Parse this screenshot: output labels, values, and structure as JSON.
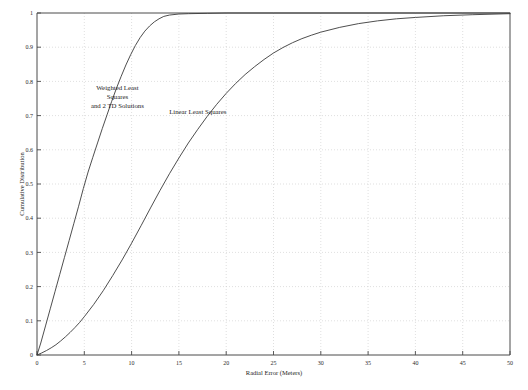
{
  "chart_data": {
    "type": "line",
    "title": "",
    "subtitle": "",
    "xlabel": "Radial Error (Meters)",
    "ylabel": "Cumulative Distribution",
    "xlim": [
      0,
      50
    ],
    "ylim": [
      0,
      1
    ],
    "grid": true,
    "legend_position": "inline-annotations",
    "xticks": [
      0,
      5,
      10,
      15,
      20,
      25,
      30,
      35,
      40,
      45,
      50
    ],
    "xtick_labels": [
      "0",
      "5",
      "10",
      "15",
      "20",
      "25",
      "30",
      "35",
      "40",
      "45",
      "50"
    ],
    "yticks": [
      0,
      0.1,
      0.2,
      0.3,
      0.4,
      0.5,
      0.6,
      0.7,
      0.8,
      0.9,
      1
    ],
    "ytick_labels": [
      "0",
      "0.1",
      "0.2",
      "0.3",
      "0.4",
      "0.5",
      "0.6",
      "0.7",
      "0.8",
      "0.9",
      "1"
    ],
    "annotations": [
      {
        "id": "weighted-least-squares-label",
        "lines": [
          "Weighted Least",
          "Squares",
          "and 2 TD Solutions"
        ],
        "x": 8.5,
        "y": 0.775
      },
      {
        "id": "linear-least-squares-label",
        "lines": [
          "Linear Least Squares"
        ],
        "x": 17.0,
        "y": 0.705
      }
    ],
    "series": [
      {
        "name": "Weighted Least Squares and 2 TD Solutions",
        "color": "#3a3a3a",
        "x": [
          0,
          0.4,
          0.9,
          1.4,
          1.9,
          2.4,
          2.9,
          3.4,
          3.9,
          4.4,
          4.9,
          5.4,
          5.9,
          6.4,
          6.9,
          7.4,
          7.9,
          8.4,
          8.9,
          9.4,
          9.9,
          10.4,
          10.9,
          11.4,
          11.9,
          12.4,
          12.9,
          13.4,
          14.0,
          15.0,
          16.0,
          18.0,
          20.0,
          25.0,
          30.0,
          35.0,
          40.0,
          45.0,
          50.0
        ],
        "y": [
          0,
          0.035,
          0.085,
          0.135,
          0.185,
          0.235,
          0.285,
          0.335,
          0.385,
          0.435,
          0.487,
          0.535,
          0.578,
          0.62,
          0.662,
          0.702,
          0.742,
          0.78,
          0.815,
          0.848,
          0.878,
          0.905,
          0.928,
          0.947,
          0.962,
          0.974,
          0.983,
          0.99,
          0.994,
          0.997,
          0.998,
          0.999,
          1.0,
          1.0,
          1.0,
          1.0,
          1.0,
          1.0,
          1.0
        ]
      },
      {
        "name": "Linear Least Squares",
        "color": "#3a3a3a",
        "x": [
          0,
          0.5,
          1.0,
          1.5,
          2.0,
          2.5,
          3.0,
          3.5,
          4.0,
          4.5,
          5.0,
          6.0,
          7.0,
          8.0,
          9.0,
          10.0,
          11.0,
          12.0,
          13.0,
          14.0,
          15.0,
          16.0,
          17.0,
          18.0,
          19.0,
          20.0,
          21.0,
          22.0,
          23.0,
          24.0,
          25.0,
          26.0,
          27.0,
          28.0,
          29.0,
          30.0,
          32.0,
          34.0,
          36.0,
          38.0,
          40.0,
          43.0,
          46.0,
          50.0
        ],
        "y": [
          0,
          0.006,
          0.013,
          0.021,
          0.03,
          0.041,
          0.053,
          0.066,
          0.08,
          0.095,
          0.112,
          0.148,
          0.188,
          0.232,
          0.278,
          0.327,
          0.378,
          0.43,
          0.481,
          0.53,
          0.576,
          0.62,
          0.66,
          0.698,
          0.733,
          0.765,
          0.794,
          0.82,
          0.843,
          0.864,
          0.883,
          0.899,
          0.913,
          0.925,
          0.935,
          0.944,
          0.958,
          0.969,
          0.977,
          0.983,
          0.987,
          0.992,
          0.995,
          0.998
        ]
      }
    ]
  },
  "figure": {
    "background_color": "#ffffff",
    "axis_color": "#4a4a4a",
    "grid_color": "#c9c9c9",
    "curve_color": "#3a3a3a"
  }
}
